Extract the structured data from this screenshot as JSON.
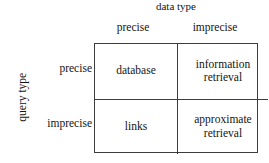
{
  "figure": {
    "type": "2x2-classification-matrix",
    "column_axis_title": "data type",
    "row_axis_title": "query type",
    "column_headers": [
      "precise",
      "imprecise"
    ],
    "row_headers": [
      "precise",
      "imprecise"
    ],
    "cells": [
      [
        {
          "line1": "database",
          "line2": ""
        },
        {
          "line1": "information",
          "line2": "retrieval"
        }
      ],
      [
        {
          "line1": "links",
          "line2": ""
        },
        {
          "line1": "approximate",
          "line2": "retrieval"
        }
      ]
    ],
    "colors": {
      "background": "#ffffff",
      "text": "#141414",
      "border": "#3c3c3c"
    }
  }
}
